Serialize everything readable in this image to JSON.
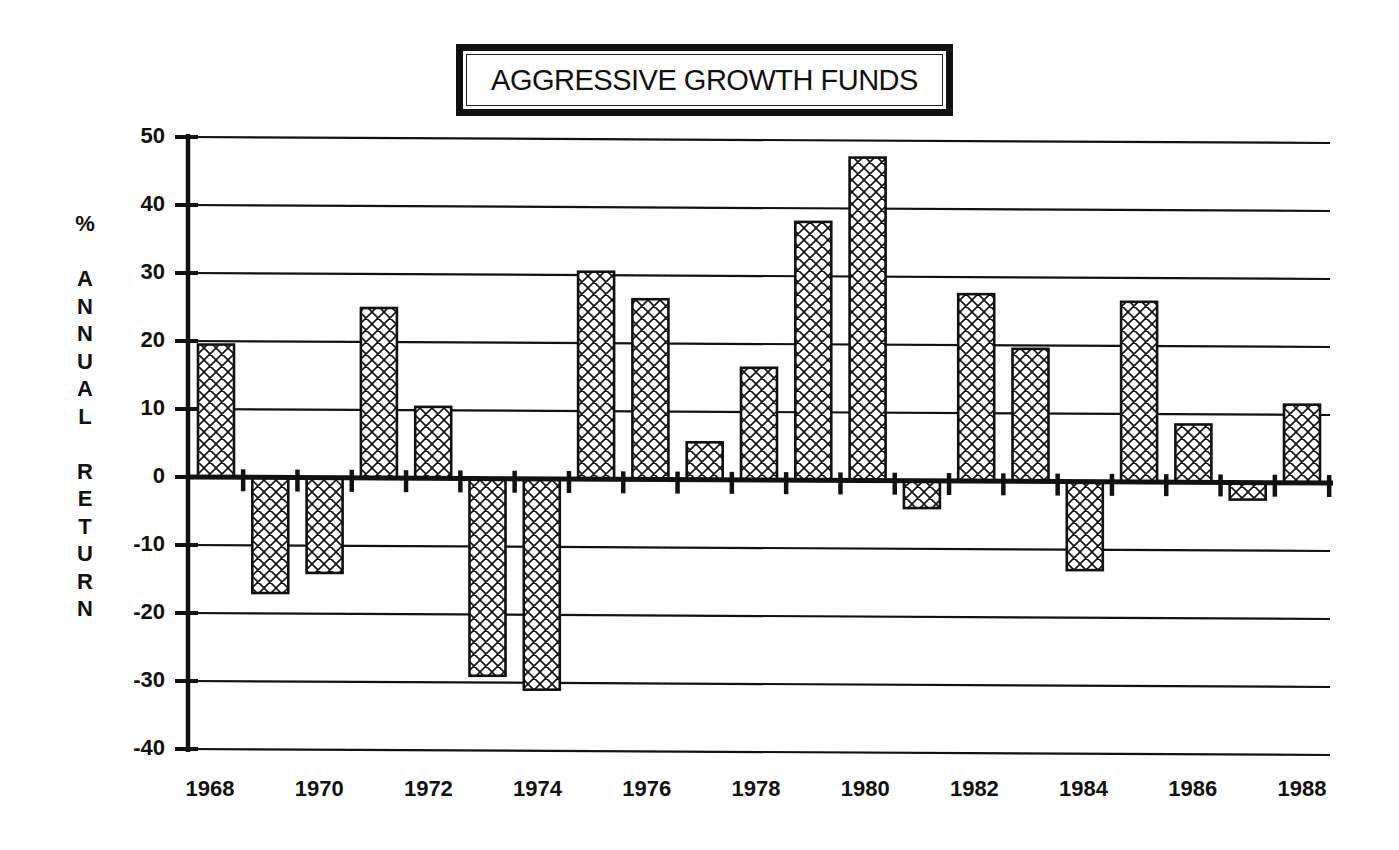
{
  "title": "AGGRESSIVE GROWTH FUNDS",
  "y_axis_label_lines": [
    "%",
    "",
    "A",
    "N",
    "N",
    "U",
    "A",
    "L",
    "",
    "R",
    "E",
    "T",
    "U",
    "R",
    "N"
  ],
  "y_ticks": [
    "50",
    "40",
    "30",
    "20",
    "10",
    "0",
    "-10",
    "-20",
    "-30",
    "-40"
  ],
  "x_ticks": [
    "1968",
    "1970",
    "1972",
    "1974",
    "1976",
    "1978",
    "1980",
    "1982",
    "1984",
    "1986",
    "1988"
  ],
  "colors": {
    "ink": "#111111",
    "background": "#ffffff"
  },
  "chart_data": {
    "type": "bar",
    "title": "AGGRESSIVE GROWTH FUNDS",
    "xlabel": "",
    "ylabel": "% ANNUAL RETURN",
    "categories": [
      "1968",
      "1969",
      "1970",
      "1971",
      "1972",
      "1973",
      "1974",
      "1975",
      "1976",
      "1977",
      "1978",
      "1979",
      "1980",
      "1981",
      "1982",
      "1983",
      "1984",
      "1985",
      "1986",
      "1987",
      "1988"
    ],
    "values": [
      19.5,
      -17,
      -14,
      25,
      10.5,
      -29,
      -31,
      30.5,
      26.5,
      5.5,
      16.5,
      38,
      47.5,
      -4,
      27.5,
      19.5,
      -13,
      26.5,
      8.5,
      -2.5,
      11.5
    ],
    "ylim": [
      -40,
      50
    ],
    "yticks": [
      50,
      40,
      30,
      20,
      10,
      0,
      -10,
      -20,
      -30,
      -40
    ],
    "xticks_labeled": [
      "1968",
      "1970",
      "1972",
      "1974",
      "1976",
      "1978",
      "1980",
      "1982",
      "1984",
      "1986",
      "1988"
    ],
    "grid": true,
    "bar_fill": "crosshatch",
    "legend": null
  }
}
